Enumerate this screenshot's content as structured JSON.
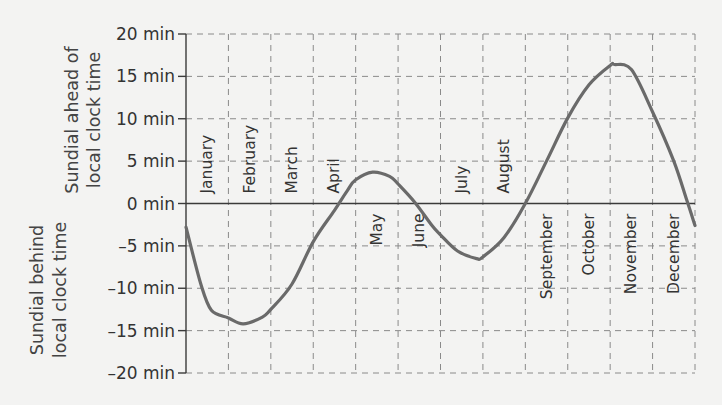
{
  "chart_data": {
    "type": "line",
    "title": "",
    "xlabel": "",
    "ylabel_positive": "Sundial ahead of local clock time",
    "ylabel_negative": "Sundial behind local clock time",
    "ylabel_lines": {
      "positive": [
        "Sundial ahead of",
        "local clock time"
      ],
      "negative": [
        "Sundial behind",
        "local clock time"
      ]
    },
    "ylim": [
      -20,
      20
    ],
    "yticks": [
      20,
      15,
      10,
      5,
      0,
      -5,
      -10,
      -15,
      -20
    ],
    "ytick_labels": [
      "20 min",
      "15 min",
      "10 min",
      "5 min",
      "0 min",
      "-5 min",
      "-10 min",
      "-15 min",
      "-20 min"
    ],
    "grid": true,
    "categories": [
      "January",
      "February",
      "March",
      "April",
      "May",
      "June",
      "July",
      "August",
      "September",
      "October",
      "November",
      "December"
    ],
    "month_label_position": [
      "above",
      "above",
      "above",
      "above",
      "below",
      "below",
      "above",
      "above",
      "below",
      "below",
      "below",
      "below"
    ],
    "series": [
      {
        "name": "Equation of time",
        "x_month_fraction": [
          0.0,
          0.35,
          0.6,
          1.0,
          1.35,
          1.8,
          2.0,
          2.5,
          3.0,
          3.5,
          3.8,
          4.0,
          4.4,
          4.8,
          5.0,
          5.4,
          5.8,
          6.0,
          6.4,
          6.85,
          7.0,
          7.5,
          8.0,
          8.5,
          9.0,
          9.5,
          10.0,
          10.1,
          10.5,
          11.0,
          11.5,
          11.8,
          12.0
        ],
        "values_min": [
          -2.8,
          -9.5,
          -12.6,
          -13.5,
          -14.2,
          -13.4,
          -12.5,
          -9.5,
          -4.5,
          -0.8,
          1.5,
          2.8,
          3.7,
          3.2,
          2.3,
          0.1,
          -2.6,
          -3.7,
          -5.6,
          -6.5,
          -6.3,
          -4.0,
          0.0,
          5.0,
          10.1,
          14.0,
          16.3,
          16.4,
          15.8,
          10.8,
          5.0,
          0.5,
          -2.6
        ]
      }
    ],
    "extrema": [
      {
        "label": "min",
        "month": "February",
        "value": -14.2
      },
      {
        "label": "max",
        "month": "May",
        "value": 3.7
      },
      {
        "label": "min",
        "month": "July",
        "value": -6.5
      },
      {
        "label": "max",
        "month": "November",
        "value": 16.4
      }
    ]
  }
}
